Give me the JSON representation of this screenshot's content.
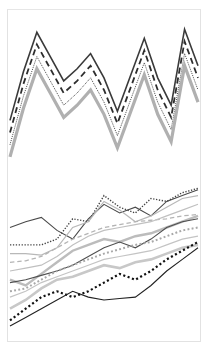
{
  "figure": {
    "title": "",
    "background_color": "#ffffff",
    "frame_color": "#e2e2e2",
    "width": 207,
    "height": 355
  },
  "chart_data": [
    {
      "type": "line",
      "panel_name": "top-zigzag-panel",
      "title": "",
      "subtitle": "",
      "xlabel": "",
      "ylabel": "",
      "grid": false,
      "legend_position": "none",
      "axis_visible": false,
      "tick_labels_x": [],
      "tick_labels_y": [],
      "xlim": [
        0,
        14
      ],
      "ylim": [
        0,
        100
      ],
      "x": [
        0,
        1,
        2,
        3,
        4,
        5,
        6,
        7,
        8,
        9,
        10,
        11,
        12,
        13,
        14
      ],
      "series": [
        {
          "name": "series-solid-dark",
          "style": "solid",
          "color": "#3a3a3a",
          "width": 1.6,
          "values": [
            30,
            62,
            88,
            72,
            56,
            64,
            74,
            58,
            36,
            60,
            84,
            58,
            40,
            90,
            66
          ]
        },
        {
          "name": "series-dashed-dark",
          "style": "dashed",
          "color": "#2e2e2e",
          "width": 1.8,
          "values": [
            22,
            54,
            80,
            64,
            48,
            56,
            66,
            50,
            28,
            52,
            76,
            50,
            32,
            82,
            58
          ]
        },
        {
          "name": "series-dotted-thin",
          "style": "dotted",
          "color": "#3c3c3c",
          "width": 1.0,
          "values": [
            14,
            46,
            72,
            56,
            40,
            48,
            58,
            42,
            20,
            44,
            68,
            42,
            24,
            74,
            50
          ]
        },
        {
          "name": "series-solid-thick-gray",
          "style": "solid",
          "color": "#b0b0b0",
          "width": 3.2,
          "values": [
            6,
            38,
            64,
            48,
            32,
            40,
            50,
            34,
            12,
            36,
            60,
            34,
            16,
            66,
            42
          ]
        }
      ]
    },
    {
      "type": "line",
      "panel_name": "bottom-spaghetti-panel",
      "title": "",
      "subtitle": "",
      "xlabel": "",
      "ylabel": "",
      "grid": false,
      "legend_position": "none",
      "axis_visible": false,
      "tick_labels_x": [],
      "tick_labels_y": [],
      "xlim": [
        0,
        12
      ],
      "ylim": [
        0,
        100
      ],
      "x": [
        0,
        1,
        2,
        3,
        4,
        5,
        6,
        7,
        8,
        9,
        10,
        11,
        12
      ],
      "series": [
        {
          "name": "line-dark-solid-upper",
          "style": "solid",
          "color": "#4a4a4a",
          "width": 1.1,
          "values": [
            70,
            74,
            77,
            68,
            62,
            76,
            86,
            80,
            84,
            78,
            88,
            92,
            96
          ]
        },
        {
          "name": "line-dark-dotted-upper",
          "style": "dotted",
          "color": "#444444",
          "width": 1.4,
          "values": [
            58,
            58,
            58,
            62,
            76,
            74,
            92,
            84,
            80,
            90,
            88,
            94,
            97
          ]
        },
        {
          "name": "line-gray-solid-a",
          "style": "solid",
          "color": "#b8b8b8",
          "width": 1.2,
          "values": [
            52,
            52,
            51,
            56,
            70,
            74,
            88,
            82,
            74,
            78,
            84,
            90,
            92
          ]
        },
        {
          "name": "line-gray-dashed-a",
          "style": "dashed",
          "color": "#b4b4b4",
          "width": 1.3,
          "values": [
            46,
            47,
            50,
            56,
            62,
            66,
            70,
            72,
            74,
            75,
            76,
            78,
            79
          ]
        },
        {
          "name": "line-gray-solid-b",
          "style": "solid",
          "color": "#c0c0c0",
          "width": 1.2,
          "values": [
            40,
            42,
            44,
            50,
            58,
            64,
            68,
            70,
            72,
            74,
            78,
            82,
            86
          ]
        },
        {
          "name": "line-gray-thick-c",
          "style": "solid",
          "color": "#bcbcbc",
          "width": 2.4,
          "values": [
            34,
            30,
            38,
            46,
            54,
            58,
            62,
            60,
            64,
            66,
            70,
            74,
            78
          ]
        },
        {
          "name": "line-dark-solid-mid",
          "style": "solid",
          "color": "#4f4f4f",
          "width": 1.1,
          "values": [
            32,
            34,
            37,
            40,
            44,
            50,
            56,
            60,
            56,
            62,
            70,
            74,
            76
          ]
        },
        {
          "name": "line-gray-dotted-mid",
          "style": "dotted",
          "color": "#a8a8a8",
          "width": 2.0,
          "values": [
            26,
            28,
            34,
            40,
            44,
            48,
            52,
            55,
            58,
            60,
            64,
            68,
            70
          ]
        },
        {
          "name": "line-gray-solid-d",
          "style": "solid",
          "color": "#c4c4c4",
          "width": 1.2,
          "values": [
            22,
            26,
            32,
            36,
            40,
            44,
            48,
            50,
            52,
            54,
            58,
            62,
            64
          ]
        },
        {
          "name": "line-gray-thick-e",
          "style": "solid",
          "color": "#c8c8c8",
          "width": 2.6,
          "values": [
            14,
            20,
            28,
            34,
            36,
            40,
            44,
            42,
            46,
            48,
            52,
            56,
            58
          ]
        },
        {
          "name": "line-black-dotted-lower",
          "style": "dotted",
          "color": "#111111",
          "width": 2.2,
          "values": [
            6,
            14,
            22,
            26,
            22,
            26,
            32,
            38,
            34,
            40,
            48,
            54,
            60
          ]
        },
        {
          "name": "line-black-solid-lowest",
          "style": "solid",
          "color": "#222222",
          "width": 1.1,
          "values": [
            2,
            8,
            14,
            20,
            26,
            22,
            20,
            21,
            22,
            30,
            40,
            48,
            56
          ]
        }
      ]
    }
  ]
}
